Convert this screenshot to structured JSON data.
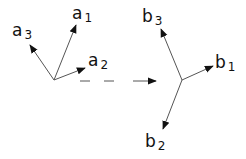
{
  "diagram": {
    "frame_a": {
      "vectors": [
        {
          "id": "a1",
          "base": "a",
          "sub": "1"
        },
        {
          "id": "a2",
          "base": "a",
          "sub": "2"
        },
        {
          "id": "a3",
          "base": "a",
          "sub": "3"
        }
      ]
    },
    "frame_b": {
      "vectors": [
        {
          "id": "b1",
          "base": "b",
          "sub": "1"
        },
        {
          "id": "b2",
          "base": "b",
          "sub": "2"
        },
        {
          "id": "b3",
          "base": "b",
          "sub": "3"
        }
      ]
    },
    "transform_arrow": {
      "style": "dashed"
    },
    "colors": {
      "stroke": "#555555",
      "arrowhead": "#111111",
      "text": "#111111"
    }
  }
}
